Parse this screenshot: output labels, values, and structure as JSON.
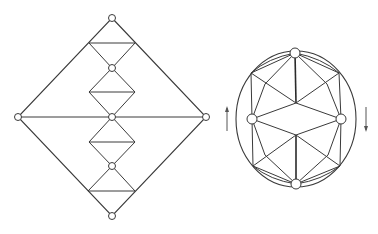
{
  "figure": {
    "left_graph": {
      "nodes": [
        {
          "id": "top",
          "x": 112,
          "y": 18
        },
        {
          "id": "upper",
          "x": 112,
          "y": 68
        },
        {
          "id": "center",
          "x": 112,
          "y": 117
        },
        {
          "id": "lower",
          "x": 112,
          "y": 166
        },
        {
          "id": "bottom",
          "x": 112,
          "y": 216
        },
        {
          "id": "left",
          "x": 18,
          "y": 117
        },
        {
          "id": "right",
          "x": 206,
          "y": 117
        }
      ],
      "bar_levels_y": [
        43,
        92,
        142,
        191
      ],
      "bar_half_width": 23
    },
    "right_graph": {
      "ellipse": {
        "cx": 296,
        "cy": 119,
        "rx": 60,
        "ry": 68
      },
      "nodes": [
        {
          "id": "top",
          "x": 295,
          "y": 53
        },
        {
          "id": "bottom",
          "x": 296,
          "y": 184
        },
        {
          "id": "left",
          "x": 252,
          "y": 119
        },
        {
          "id": "right",
          "x": 341,
          "y": 119
        }
      ],
      "arrows": [
        {
          "id": "left-arrow",
          "direction": "up",
          "x": 228,
          "y1": 130,
          "y2": 108
        },
        {
          "id": "right-arrow",
          "direction": "down",
          "x": 365,
          "y1": 108,
          "y2": 130
        }
      ]
    }
  }
}
